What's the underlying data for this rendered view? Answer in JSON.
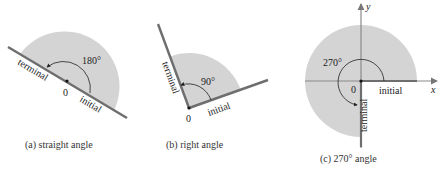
{
  "figure": {
    "panels": [
      {
        "id": "a",
        "caption": "(a)  straight angle",
        "angle_label": "180°",
        "origin_label": "0",
        "terminal_label": "terminal",
        "initial_label": "initial"
      },
      {
        "id": "b",
        "caption": "(b)  right angle",
        "angle_label": "90°",
        "origin_label": "0",
        "terminal_label": "terminal",
        "initial_label": "initial"
      },
      {
        "id": "c",
        "caption": "(c)  270° angle",
        "angle_label": "270°",
        "origin_label": "0",
        "terminal_label": "terminal",
        "initial_label": "initial",
        "x_axis_label": "x",
        "y_axis_label": "y"
      }
    ],
    "colors": {
      "shade": "#d4d4d4",
      "ray": "#6e6e6e",
      "text": "#222222"
    }
  }
}
